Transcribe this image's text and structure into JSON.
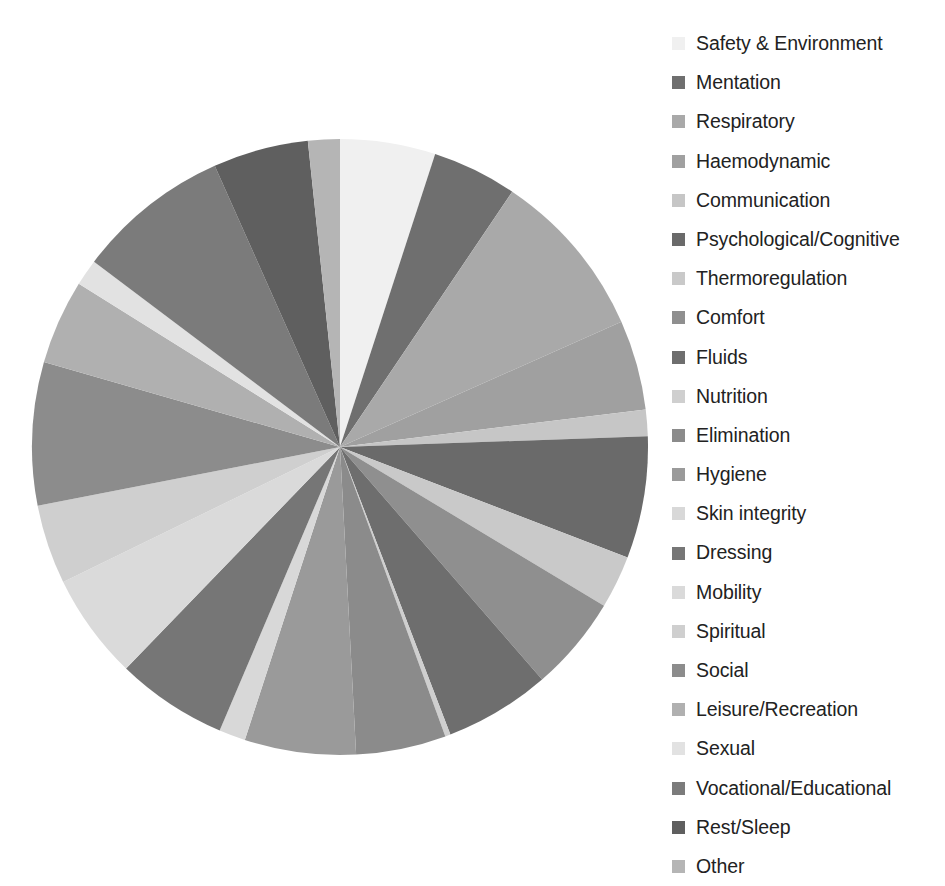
{
  "chart_data": {
    "type": "pie",
    "title": "",
    "subtitle": "",
    "xlabel": "",
    "ylabel": "",
    "legend_position": "right",
    "grid": false,
    "start_angle_deg": 0,
    "direction": "clockwise",
    "center": {
      "x": 340,
      "y": 447
    },
    "radius": 308,
    "labels": [
      "Safety & Environment",
      "Mentation",
      "Respiratory",
      "Haemodynamic",
      "Communication",
      "Psychological/Cognitive",
      "Thermoregulation",
      "Comfort",
      "Fluids",
      "Nutrition",
      "Elimination",
      "Hygiene",
      "Skin integrity",
      "Dressing",
      "Mobility",
      "Spiritual",
      "Social",
      "Leisure/Recreation",
      "Sexual",
      "Vocational/Educational",
      "Rest/Sleep",
      "Other"
    ],
    "values": [
      18.0,
      16.0,
      32.0,
      17.0,
      5.0,
      23.0,
      10.0,
      18.0,
      20.0,
      1.0,
      17.0,
      21.0,
      5.0,
      21.0,
      20.0,
      15.0,
      27.0,
      16.0,
      5.0,
      29.0,
      18.0,
      6.0
    ],
    "value_unit": "degrees",
    "colors": [
      "#f0f0f0",
      "#6f6f6f",
      "#a9a9a9",
      "#a0a0a0",
      "#c6c6c6",
      "#6a6a6a",
      "#c9c9c9",
      "#8f8f8f",
      "#6e6e6e",
      "#cfcfcf",
      "#8b8b8b",
      "#9a9a9a",
      "#d8d8d8",
      "#767676",
      "#dadada",
      "#cfcfcf",
      "#8c8c8c",
      "#b0b0b0",
      "#e2e2e2",
      "#7b7b7b",
      "#5f5f5f",
      "#b5b5b5"
    ]
  },
  "legend": {
    "items": [
      {
        "label": "Safety & Environment",
        "color": "#f0f0f0"
      },
      {
        "label": "Mentation",
        "color": "#6f6f6f"
      },
      {
        "label": "Respiratory",
        "color": "#a9a9a9"
      },
      {
        "label": "Haemodynamic",
        "color": "#a0a0a0"
      },
      {
        "label": "Communication",
        "color": "#c6c6c6"
      },
      {
        "label": "Psychological/Cognitive",
        "color": "#6a6a6a"
      },
      {
        "label": "Thermoregulation",
        "color": "#c9c9c9"
      },
      {
        "label": "Comfort",
        "color": "#8f8f8f"
      },
      {
        "label": "Fluids",
        "color": "#6e6e6e"
      },
      {
        "label": "Nutrition",
        "color": "#cfcfcf"
      },
      {
        "label": "Elimination",
        "color": "#8b8b8b"
      },
      {
        "label": "Hygiene",
        "color": "#9a9a9a"
      },
      {
        "label": "Skin integrity",
        "color": "#d8d8d8"
      },
      {
        "label": "Dressing",
        "color": "#767676"
      },
      {
        "label": "Mobility",
        "color": "#dadada"
      },
      {
        "label": "Spiritual",
        "color": "#cfcfcf"
      },
      {
        "label": "Social",
        "color": "#8c8c8c"
      },
      {
        "label": "Leisure/Recreation",
        "color": "#b0b0b0"
      },
      {
        "label": "Sexual",
        "color": "#e2e2e2"
      },
      {
        "label": "Vocational/Educational",
        "color": "#7b7b7b"
      },
      {
        "label": "Rest/Sleep",
        "color": "#5f5f5f"
      },
      {
        "label": "Other",
        "color": "#b5b5b5"
      }
    ]
  }
}
